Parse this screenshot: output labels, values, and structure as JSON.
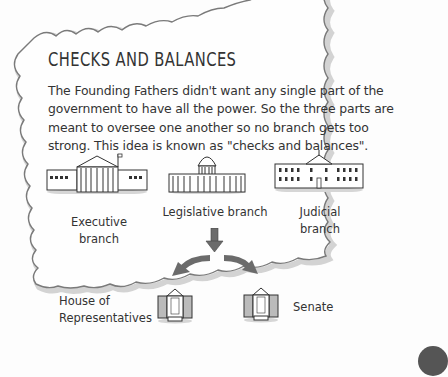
{
  "section": {
    "title": "CHECKS AND BALANCES",
    "paragraph": "The Founding Fathers didn't want any single part of the government to have all the power. So the three parts are meant to oversee one another so no branch gets too strong. This idea is known as \"checks and balances\"."
  },
  "diagram": {
    "branches": [
      {
        "label_line1": "Executive",
        "label_line2": "branch",
        "icon": "executive-building-icon"
      },
      {
        "label_line1": "Legislative branch",
        "label_line2": "",
        "icon": "capitol-building-icon"
      },
      {
        "label_line1": "Judicial",
        "label_line2": "branch",
        "icon": "white-house-building-icon"
      }
    ],
    "subdivisions": [
      {
        "label_line1": "House of",
        "label_line2": "Representatives",
        "icon": "house-chamber-icon"
      },
      {
        "label_line1": "Senate",
        "label_line2": "",
        "icon": "senate-chamber-icon"
      }
    ],
    "arrow_color": "#6b6b6b"
  },
  "colors": {
    "border": "#8a8a8a",
    "border_shadow": "#cfcfcf",
    "text": "#333333",
    "background": "#fdfdfd"
  }
}
